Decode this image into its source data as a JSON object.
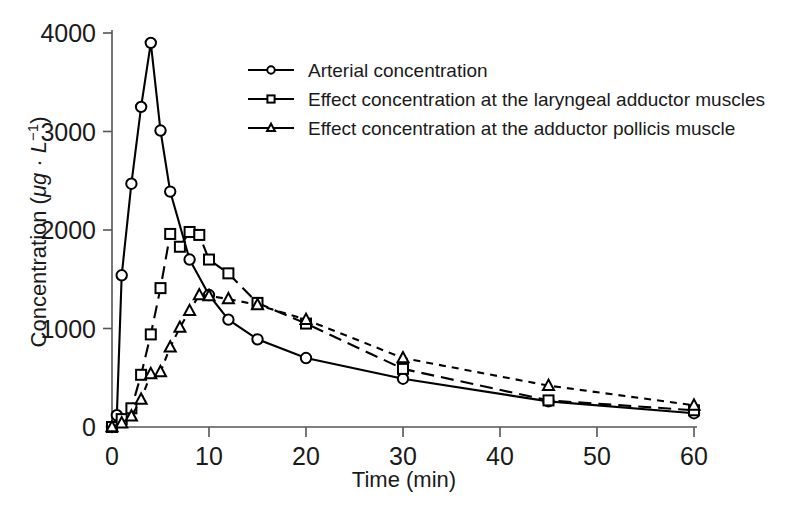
{
  "chart_data": {
    "type": "line",
    "title": "",
    "xlabel": "Time (min)",
    "ylabel": "Concentration (μg · L⁻¹)",
    "xlim": [
      0,
      60
    ],
    "ylim": [
      0,
      4000
    ],
    "xticks": [
      0,
      10,
      20,
      30,
      40,
      50,
      60
    ],
    "yticks": [
      0,
      1000,
      2000,
      3000,
      4000
    ],
    "xtick_labels": [
      "0",
      "10",
      "20",
      "30",
      "40",
      "50",
      "60"
    ],
    "ytick_labels": [
      "0",
      "1000",
      "2000",
      "3000",
      "4000"
    ],
    "grid": false,
    "legend_position": "upper right",
    "series": [
      {
        "name": "Arterial concentration",
        "marker": "circle",
        "linestyle": "solid",
        "x": [
          0,
          0.5,
          1,
          2,
          3,
          4,
          5,
          6,
          8,
          10,
          12,
          15,
          20,
          30,
          45,
          60
        ],
        "y": [
          0,
          120,
          1540,
          2470,
          3250,
          3900,
          3010,
          2390,
          1700,
          1340,
          1090,
          890,
          700,
          490,
          260,
          140
        ]
      },
      {
        "name": "Effect concentration at the laryngeal adductor muscles",
        "marker": "square",
        "linestyle": "long-dash",
        "x": [
          0,
          1,
          2,
          3,
          4,
          5,
          6,
          7,
          8,
          9,
          10,
          12,
          15,
          20,
          30,
          45,
          60
        ],
        "y": [
          0,
          80,
          190,
          530,
          940,
          1410,
          1960,
          1830,
          1980,
          1950,
          1700,
          1560,
          1260,
          1050,
          590,
          270,
          170
        ]
      },
      {
        "name": "Effect concentration at the adductor pollicis muscle",
        "marker": "triangle",
        "linestyle": "short-dash",
        "x": [
          0,
          1,
          2,
          3,
          4,
          5,
          6,
          7,
          8,
          9,
          10,
          12,
          15,
          20,
          30,
          45,
          60
        ],
        "y": [
          0,
          40,
          110,
          280,
          540,
          560,
          810,
          1010,
          1180,
          1340,
          1330,
          1300,
          1240,
          1090,
          700,
          420,
          220
        ]
      }
    ]
  },
  "legend": {
    "items": [
      {
        "label": "Arterial concentration",
        "marker": "circle"
      },
      {
        "label": "Effect concentration at the laryngeal adductor muscles",
        "marker": "square"
      },
      {
        "label": "Effect concentration at the adductor pollicis muscle",
        "marker": "triangle"
      }
    ]
  },
  "axes": {
    "x_title": "Time (min)",
    "y_title_prefix": "Concentration (",
    "y_title_unit": "μg · L",
    "y_title_exp": "−1",
    "y_title_suffix": ")"
  }
}
